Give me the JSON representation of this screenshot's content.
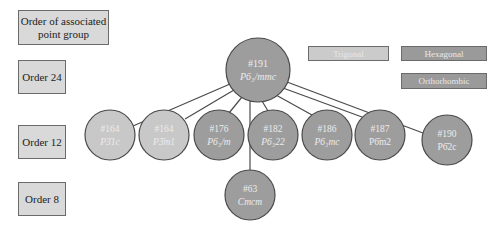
{
  "order_labels": {
    "header": "Order of associated point group",
    "order24": "Order 24",
    "order12": "Order 12",
    "order8": "Order 8"
  },
  "legend": {
    "trigonal": {
      "label": "Trigonal",
      "color": "#c8c8c8"
    },
    "hexagonal": {
      "label": "Hexagonal",
      "color": "#9a9a9a"
    },
    "orthorhombic": {
      "label": "Orthorhombic",
      "color": "#9a9a9a"
    }
  },
  "colors": {
    "trigonal_fill": "#c8c8c8",
    "hexagonal_fill": "#9d9d9d",
    "orthorhombic_fill": "#9d9d9d",
    "stroke": "#4a4a4a",
    "order_box_fill": "#d9d9d9"
  },
  "nodes": {
    "root": {
      "number": "#191",
      "symbol": "P6₃/mmc",
      "system": "hexagonal",
      "order": 24
    },
    "n164a": {
      "number": "#164",
      "symbol": "P3̄1c",
      "system": "trigonal",
      "order": 12
    },
    "n164b": {
      "number": "#164",
      "symbol": "P3̄m1",
      "system": "trigonal",
      "order": 12
    },
    "n176": {
      "number": "#176",
      "symbol": "P6₃/m",
      "system": "hexagonal",
      "order": 12
    },
    "n182": {
      "number": "#182",
      "symbol": "P6₃22",
      "system": "hexagonal",
      "order": 12
    },
    "n186": {
      "number": "#186",
      "symbol": "P6₃mc",
      "system": "hexagonal",
      "order": 12
    },
    "n187": {
      "number": "#187",
      "symbol": "P6̄m2",
      "system": "hexagonal",
      "order": 12
    },
    "n190": {
      "number": "#190",
      "symbol": "P6̄2c",
      "system": "hexagonal",
      "order": 12
    },
    "n63": {
      "number": "#63",
      "symbol": "Cmcm",
      "system": "orthorhombic",
      "order": 8
    }
  }
}
